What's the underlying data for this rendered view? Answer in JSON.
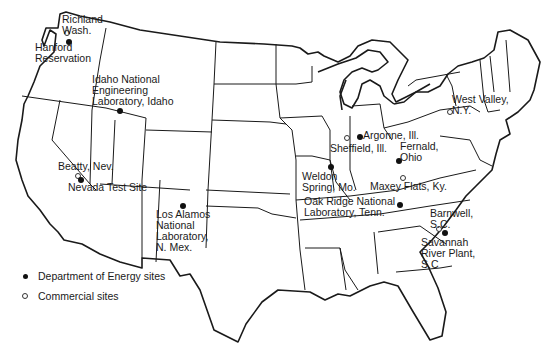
{
  "map": {
    "subject": "Nuclear waste / radioactive sites in the contiguous United States",
    "colors": {
      "ink": "#1a1a1a",
      "background": "#ffffff"
    },
    "legend": [
      {
        "symbol": "filled-dot",
        "label": "Department of Energy sites"
      },
      {
        "symbol": "open-dot",
        "label": "Commercial sites"
      }
    ],
    "sites": [
      {
        "id": "richland",
        "type": "commercial",
        "label": "Richland\nWash."
      },
      {
        "id": "hanford",
        "type": "doe",
        "label": "Hanford\nReservation"
      },
      {
        "id": "idaho",
        "type": "doe",
        "label": "Idaho National\nEngineering\nLaboratory, Idaho"
      },
      {
        "id": "beatty",
        "type": "commercial",
        "label": "Beatty, Nev."
      },
      {
        "id": "nevada",
        "type": "doe",
        "label": "Nevada Test Site"
      },
      {
        "id": "losalamos",
        "type": "doe",
        "label": "Los Alamos\nNational\nLaboratory,\nN. Mex."
      },
      {
        "id": "weldon",
        "type": "doe",
        "label": "Weldon\nSpring, Mo."
      },
      {
        "id": "sheffield",
        "type": "commercial",
        "label": "Sheffield, Ill."
      },
      {
        "id": "argonne",
        "type": "doe",
        "label": "Argonne, Ill."
      },
      {
        "id": "fernald",
        "type": "doe",
        "label": "Fernald,\nOhio"
      },
      {
        "id": "maxey",
        "type": "commercial",
        "label": "Maxey Flats, Ky."
      },
      {
        "id": "oakridge",
        "type": "doe",
        "label": "Oak Ridge National\nLaboratory, Tenn."
      },
      {
        "id": "westvalley",
        "type": "commercial",
        "label": "West Valley,\nN.Y."
      },
      {
        "id": "barnwell",
        "type": "commercial",
        "label": "Barnwell,\nS.C."
      },
      {
        "id": "savannah",
        "type": "doe",
        "label": "Savannah\nRiver Plant,\nS.C"
      }
    ]
  }
}
